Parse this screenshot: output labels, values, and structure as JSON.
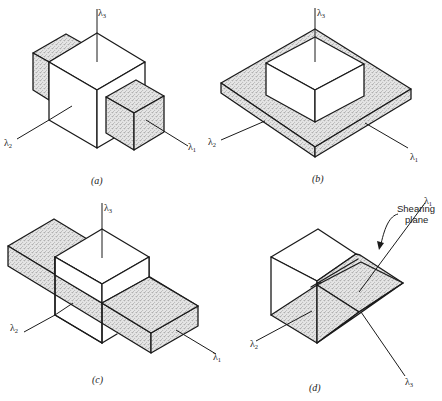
{
  "figure": {
    "panels": [
      {
        "id": "a",
        "caption": "(a)",
        "axes": {
          "l1": "λ",
          "l1_sub": "1",
          "l2": "λ",
          "l2_sub": "2",
          "l3": "λ",
          "l3_sub": "3"
        },
        "description": "Central cube with shaded smaller blocks protruding along λ1 and -λ1 directions"
      },
      {
        "id": "b",
        "caption": "(b)",
        "axes": {
          "l1": "λ",
          "l1_sub": "1",
          "l2": "λ",
          "l2_sub": "2",
          "l3": "λ",
          "l3_sub": "3"
        },
        "description": "Cube sitting on a thin shaded square plate extended in λ1 and λ2"
      },
      {
        "id": "c",
        "caption": "(c)",
        "axes": {
          "l1": "λ",
          "l1_sub": "1",
          "l2": "λ",
          "l2_sub": "2",
          "l3": "λ",
          "l3_sub": "3"
        },
        "description": "Cube intersected by a long shaded slab elongated along λ1"
      },
      {
        "id": "d",
        "caption": "(d)",
        "axes": {
          "l1": "λ",
          "l1_sub": "1",
          "l2": "λ",
          "l2_sub": "2",
          "l3": "λ",
          "l3_sub": "3"
        },
        "annotation": {
          "line1": "Shearing",
          "line2": "plane"
        },
        "description": "Cube sheared along a diagonal shearing plane forming a wedge"
      }
    ]
  }
}
